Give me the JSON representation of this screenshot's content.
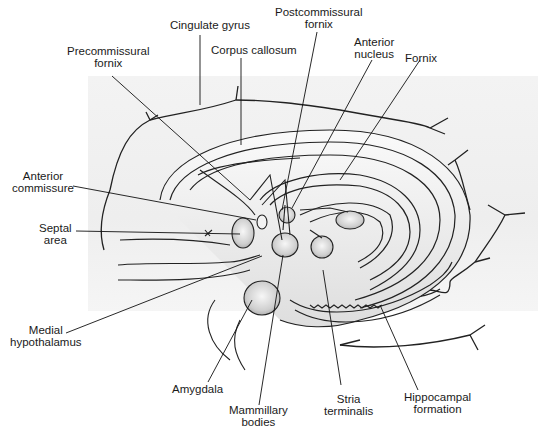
{
  "figure": {
    "background_color": "#ffffff",
    "panel_color": "#efefef",
    "line_color": "#1a1a1a",
    "structure_fill": "#d9d9d9"
  },
  "labels": {
    "cingulate_gyrus": [
      "Cingulate gyrus"
    ],
    "precommissural_fornix": [
      "Precommissural",
      "fornix"
    ],
    "corpus_callosum": [
      "Corpus callosum"
    ],
    "postcommissural_fornix": [
      "Postcommissural",
      "fornix"
    ],
    "anterior_nucleus": [
      "Anterior",
      "nucleus"
    ],
    "fornix": [
      "Fornix"
    ],
    "anterior_commissure": [
      "Anterior",
      "commissure"
    ],
    "septal_area": [
      "Septal",
      "area"
    ],
    "medial_hypothalamus": [
      "Medial",
      "hypothalamus"
    ],
    "amygdala": [
      "Amygdala"
    ],
    "mammillary_bodies": [
      "Mammillary",
      "bodies"
    ],
    "stria_terminalis": [
      "Stria",
      "terminalis"
    ],
    "hippocampal_formation": [
      "Hippocampal",
      "formation"
    ]
  }
}
